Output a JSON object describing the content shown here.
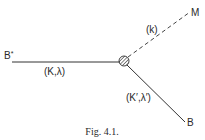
{
  "diagram": {
    "type": "feynman-vertex",
    "nodes": {
      "incoming": {
        "label": "B*",
        "x": 12,
        "y": 62
      },
      "vertex": {
        "x": 124,
        "y": 61,
        "r": 5,
        "style": "hatched"
      },
      "meson": {
        "label": "M",
        "x": 190,
        "y": 12
      },
      "outgoing": {
        "label": "B",
        "x": 185,
        "y": 122
      }
    },
    "edges": [
      {
        "from": "incoming",
        "to": "vertex",
        "style": "solid",
        "label": "(K,λ)"
      },
      {
        "from": "vertex",
        "to": "meson",
        "style": "dashed",
        "label": "(k)"
      },
      {
        "from": "vertex",
        "to": "outgoing",
        "style": "solid",
        "label": "(K′,λ′)"
      }
    ],
    "labels": {
      "b_star": "B",
      "b_star_sup": "*",
      "m": "M",
      "b": "B",
      "edge_in": "(K,λ)",
      "edge_meson": "(k)",
      "edge_out": "(K′,λ′)"
    },
    "caption": "Fig. 4.1."
  }
}
